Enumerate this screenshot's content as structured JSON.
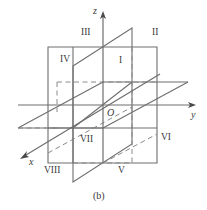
{
  "figure": {
    "caption": "(b)",
    "stroke_color": "#6e6e6e",
    "dashed_color": "#8a8a8a",
    "text_color": "#3a3a3a",
    "background": "#ffffff"
  },
  "axes": [
    {
      "id": "x",
      "label": "x",
      "direction": "down-left",
      "arrow": true
    },
    {
      "id": "y",
      "label": "y",
      "direction": "right",
      "arrow": true
    },
    {
      "id": "z",
      "label": "z",
      "direction": "up",
      "arrow": true
    }
  ],
  "origin": {
    "label": "O"
  },
  "octants": [
    {
      "id": "I",
      "label": "I"
    },
    {
      "id": "II",
      "label": "II"
    },
    {
      "id": "III",
      "label": "III"
    },
    {
      "id": "IV",
      "label": "IV"
    },
    {
      "id": "V",
      "label": "V"
    },
    {
      "id": "VI",
      "label": "VI"
    },
    {
      "id": "VII",
      "label": "VII"
    },
    {
      "id": "VIII",
      "label": "VIII"
    }
  ],
  "planes": [
    {
      "id": "yOz",
      "name": "yOz-plane",
      "shape": "rectangle"
    },
    {
      "id": "xOy",
      "name": "xOy-plane",
      "shape": "parallelogram"
    },
    {
      "id": "xOz",
      "name": "xOz-plane",
      "shape": "parallelogram"
    }
  ]
}
